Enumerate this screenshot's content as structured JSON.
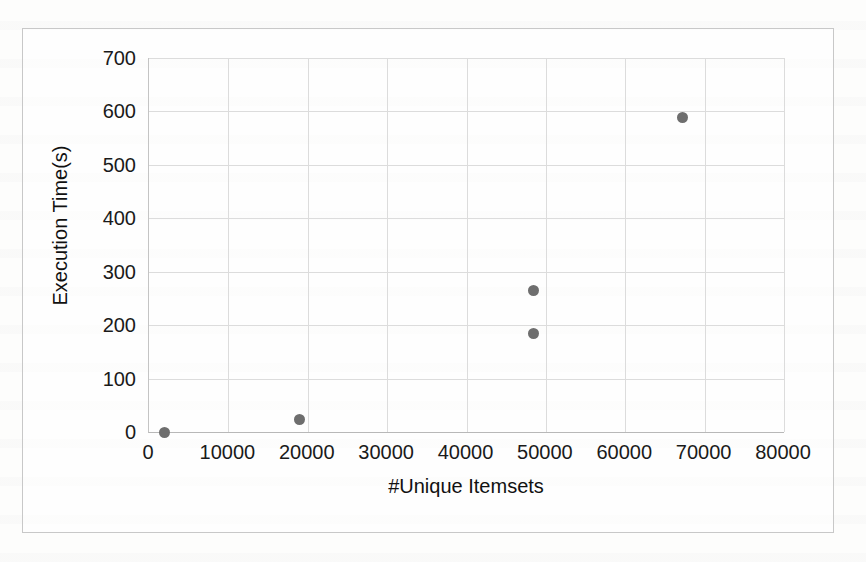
{
  "chart_data": {
    "type": "scatter",
    "title": "",
    "xlabel": "#Unique Itemsets",
    "ylabel": "Execution Time(s)",
    "xlim": [
      0,
      80000
    ],
    "ylim": [
      0,
      700
    ],
    "xticks": [
      "0",
      "10000",
      "20000",
      "30000",
      "40000",
      "50000",
      "60000",
      "70000",
      "80000"
    ],
    "xtick_values": [
      0,
      10000,
      20000,
      30000,
      40000,
      50000,
      60000,
      70000,
      80000
    ],
    "yticks": [
      "0",
      "100",
      "200",
      "300",
      "400",
      "500",
      "600",
      "700"
    ],
    "ytick_values": [
      0,
      100,
      200,
      300,
      400,
      500,
      600,
      700
    ],
    "grid": true,
    "legend": false,
    "marker_color": "#6e6e6e",
    "marker_size": 11,
    "series": [
      {
        "name": "Execution Time",
        "points": [
          {
            "x": 2000,
            "y": 0
          },
          {
            "x": 18900,
            "y": 23
          },
          {
            "x": 48400,
            "y": 185
          },
          {
            "x": 48400,
            "y": 265
          },
          {
            "x": 67200,
            "y": 588
          }
        ]
      }
    ]
  },
  "figure": {
    "border_color": "#c8c8c8",
    "grid_color": "#dcdcdc",
    "background": "#fdfdfc"
  }
}
